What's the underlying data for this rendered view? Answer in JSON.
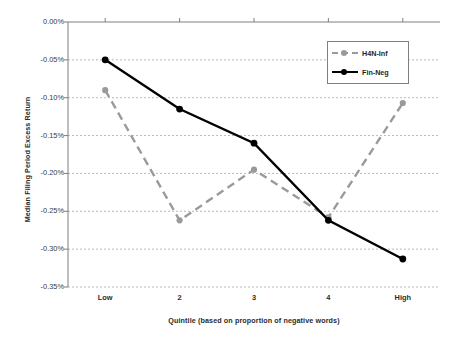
{
  "chart_data": {
    "type": "line",
    "title": "",
    "xlabel": "Quintile (based on proportion of negative words)",
    "ylabel": "Median Filing Period Excess Return",
    "categories": [
      "Low",
      "2",
      "3",
      "4",
      "High"
    ],
    "ylim": [
      -0.35,
      0.0
    ],
    "yticks": [
      0.0,
      -0.05,
      -0.1,
      -0.15,
      -0.2,
      -0.25,
      -0.3,
      -0.35
    ],
    "ytick_labels": [
      "0.00%",
      "-0.05%",
      "-0.10%",
      "-0.15%",
      "-0.20%",
      "-0.25%",
      "-0.30%",
      "-0.35%"
    ],
    "grid": true,
    "legend_position": "upper right",
    "series": [
      {
        "name": "H4N-Inf",
        "color": "#9a9a9a",
        "style": "dashed",
        "marker": "circle",
        "values": [
          -0.09,
          -0.262,
          -0.195,
          -0.258,
          -0.107
        ]
      },
      {
        "name": "Fin-Neg",
        "color": "#000000",
        "style": "solid",
        "marker": "circle",
        "values": [
          -0.05,
          -0.115,
          -0.16,
          -0.262,
          -0.313
        ]
      }
    ]
  },
  "legend": {
    "items": [
      {
        "label": "H4N-Inf"
      },
      {
        "label": "Fin-Neg"
      }
    ]
  },
  "axes": {
    "x_title": "Quintile (based on proportion of negative words)",
    "y_title": "Median Filing Period Excess Return"
  },
  "colors": {
    "series_h4n": "#9a9a9a",
    "series_finneg": "#000000",
    "grid": "#b9b9b9",
    "axis": "#7f7f7f",
    "background": "#ffffff"
  }
}
